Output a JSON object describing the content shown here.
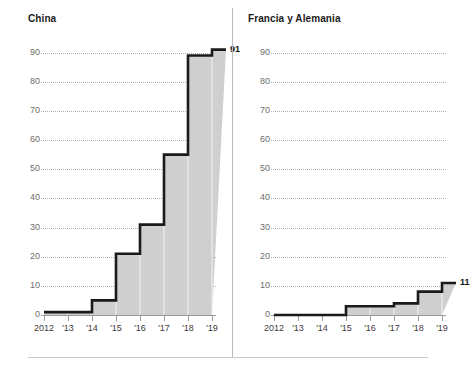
{
  "chart_data": [
    {
      "type": "area",
      "title": "China",
      "panel": "left",
      "xlabel": "",
      "ylabel": "",
      "x": [
        2012,
        2013,
        2014,
        2015,
        2016,
        2017,
        2018,
        2019
      ],
      "categories": [
        "2012",
        "'13",
        "'14",
        "'15",
        "'16",
        "'17",
        "'18",
        "'19"
      ],
      "values": [
        1,
        1,
        5,
        21,
        31,
        55,
        89,
        91
      ],
      "ylim": [
        0,
        95
      ],
      "yticks": [
        0,
        10,
        20,
        30,
        40,
        50,
        60,
        70,
        80,
        90
      ],
      "ytick_labels": [
        "0",
        "10",
        "20",
        "30",
        "40",
        "50",
        "60",
        "70",
        "80",
        "90"
      ],
      "grid": true,
      "legend": "none",
      "end_label": "91",
      "line_color": "#1a1a1a",
      "fill_color": "#cfcfcf"
    },
    {
      "type": "area",
      "title": "Francia y Alemania",
      "panel": "right",
      "xlabel": "",
      "ylabel": "",
      "x": [
        2012,
        2013,
        2014,
        2015,
        2016,
        2017,
        2018,
        2019
      ],
      "categories": [
        "2012",
        "'13",
        "'14",
        "'15",
        "'16",
        "'17",
        "'18",
        "'19"
      ],
      "values": [
        0,
        0,
        0,
        3,
        3,
        4,
        8,
        11
      ],
      "ylim": [
        0,
        95
      ],
      "yticks": [
        0,
        10,
        20,
        30,
        40,
        50,
        60,
        70,
        80,
        90
      ],
      "ytick_labels": [
        "0",
        "10",
        "20",
        "30",
        "40",
        "50",
        "60",
        "70",
        "80",
        "90"
      ],
      "grid": true,
      "legend": "none",
      "end_label": "11",
      "line_color": "#1a1a1a",
      "fill_color": "#cfcfcf"
    }
  ],
  "panels": {
    "left": {
      "title": "China",
      "end_label": "91"
    },
    "right": {
      "title": "Francia y Alemania",
      "end_label": "11"
    }
  }
}
